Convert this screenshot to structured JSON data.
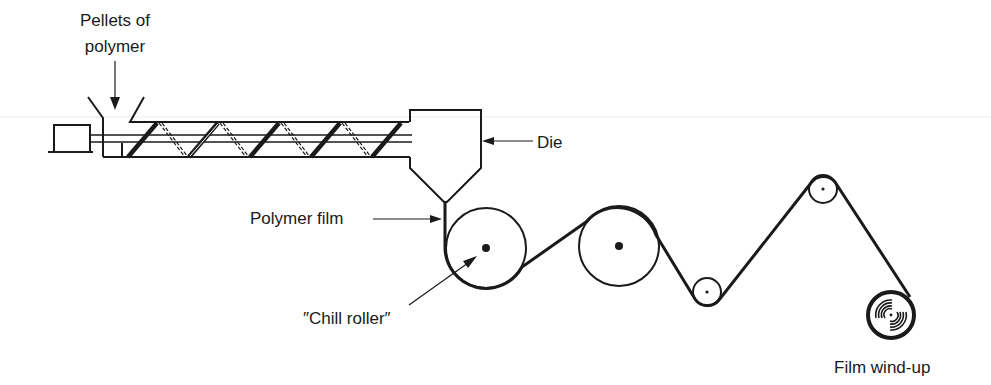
{
  "labels": {
    "pellets_line1": "Pellets of",
    "pellets_line2": "polymer",
    "die": "Die",
    "polymer_film": "Polymer film",
    "chill_roller": "″Chill roller″",
    "film_windup": "Film wind-up"
  },
  "components": [
    {
      "name": "motor",
      "type": "drive box"
    },
    {
      "name": "hopper",
      "type": "feed funnel"
    },
    {
      "name": "extruder-screw",
      "type": "screw in barrel"
    },
    {
      "name": "die",
      "type": "extrusion die"
    },
    {
      "name": "chill-roller",
      "type": "large roller"
    },
    {
      "name": "roller-2",
      "type": "large roller"
    },
    {
      "name": "roller-3",
      "type": "small idler roller"
    },
    {
      "name": "roller-4",
      "type": "small idler roller"
    },
    {
      "name": "wind-up-reel",
      "type": "take-up reel"
    }
  ],
  "colors": {
    "ink": "#1a1a1a",
    "background": "#ffffff",
    "guide_line": "#e8e8e8"
  }
}
